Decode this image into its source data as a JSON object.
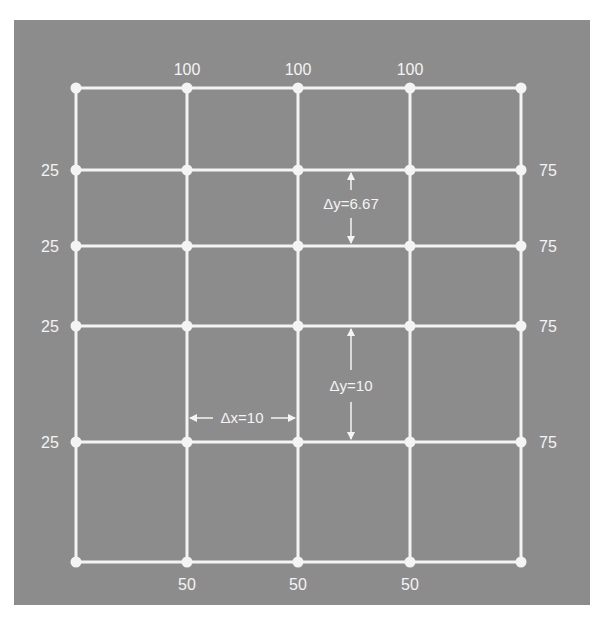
{
  "figure": {
    "background_color": "#8c8c8c",
    "line_color": "#f4f4f4",
    "grid": {
      "x_nodes": [
        76,
        187,
        298,
        410,
        521
      ],
      "y_nodes": [
        88,
        170,
        246,
        326,
        442,
        562
      ]
    },
    "boundary_labels": {
      "top": [
        "100",
        "100",
        "100"
      ],
      "bottom": [
        "50",
        "50",
        "50"
      ],
      "left": [
        "25",
        "25",
        "25",
        "25"
      ],
      "right": [
        "75",
        "75",
        "75",
        "75"
      ]
    },
    "annotations": {
      "dy_small": "Δy=6.67",
      "dy_large": "Δy=10",
      "dx": "Δx=10"
    }
  }
}
